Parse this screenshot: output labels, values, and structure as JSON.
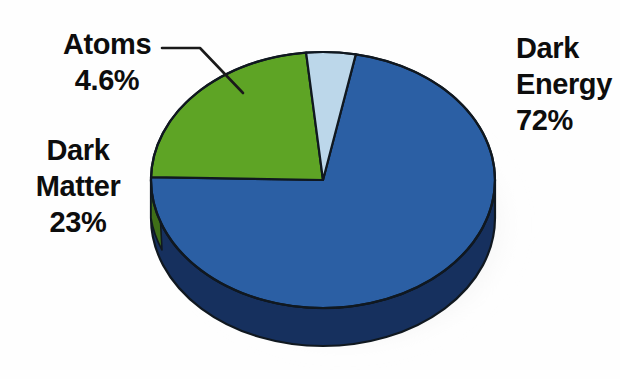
{
  "figure": {
    "name": "cosmic-composition-pie",
    "background_color": "#fefefe"
  },
  "chart_data": {
    "type": "pie",
    "title": "",
    "subtitle": "",
    "xlabel": "",
    "ylabel": "",
    "grid": false,
    "legend_position": "callout-labels",
    "three_d": true,
    "categories": [
      "Dark Energy",
      "Dark Matter",
      "Atoms"
    ],
    "values": [
      72,
      23,
      4.6
    ],
    "value_labels": [
      "72%",
      "23%",
      "4.6%"
    ],
    "colors": [
      "#2b5fa4",
      "#5ea425",
      "#bcd7ea"
    ],
    "side_colors": [
      "#16305e",
      "#3f6f18",
      "#8fa9bb"
    ],
    "units": "percent",
    "annotations": [
      {
        "text": "Atoms 4.6%",
        "leader_line": true
      },
      {
        "text": "Dark Matter 23%",
        "leader_line": false
      },
      {
        "text": "Dark Energy 72%",
        "leader_line": false
      }
    ],
    "slices": [
      {
        "label": "Dark Energy",
        "value": 72,
        "display": "72%",
        "color": "#2b5fa4"
      },
      {
        "label": "Dark Matter",
        "value": 23,
        "display": "23%",
        "color": "#5ea425"
      },
      {
        "label": "Atoms",
        "value": 4.6,
        "display": "4.6%",
        "color": "#bcd7ea"
      }
    ]
  },
  "labels": {
    "atoms": {
      "name_line": "Atoms",
      "value_line": "4.6%"
    },
    "dark_matter": {
      "name_line_1": "Dark",
      "name_line_2": "Matter",
      "value_line": "23%"
    },
    "dark_energy": {
      "name_line_1": "Dark",
      "name_line_2": "Energy",
      "value_line": "72%"
    }
  },
  "colors": {
    "dark_energy": "#2b5fa4",
    "dark_energy_side": "#16305e",
    "dark_matter": "#5ea425",
    "dark_matter_side": "#3f6f18",
    "atoms": "#bcd7ea",
    "text": "#0d0d0d",
    "outline": "#101820",
    "shadow": "#b9b9b9"
  }
}
